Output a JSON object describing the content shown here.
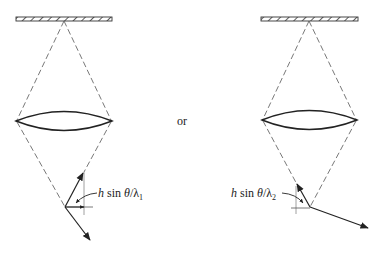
{
  "diagram": {
    "separator_text": "or",
    "left_panel": {
      "label_prefix": "h",
      "label_mid": " sin ",
      "label_theta": "θ",
      "label_slash": "/λ",
      "label_sub": "1"
    },
    "right_panel": {
      "label_prefix": "h",
      "label_mid": " sin ",
      "label_theta": "θ",
      "label_slash": "/λ",
      "label_sub": "2"
    },
    "colors": {
      "line": "#333333",
      "dashed": "#555555",
      "background": "#ffffff"
    }
  }
}
